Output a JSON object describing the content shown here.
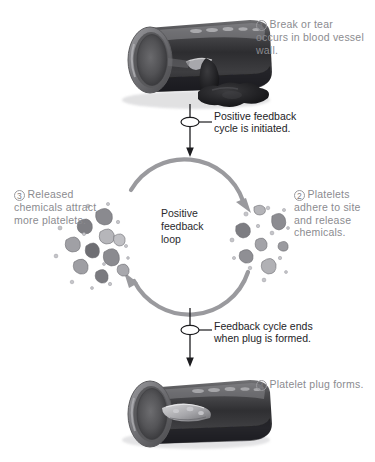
{
  "diagram": {
    "center_label": {
      "line1": "Positive",
      "line2": "feedback",
      "line3": "loop"
    },
    "steps": [
      {
        "number": "1",
        "text": "Break or tear occurs in blood vessel wall.",
        "icon": "blood-vessel-torn"
      },
      {
        "number": "2",
        "text": "Platelets adhere to site and release chemicals.",
        "icon": "platelet-cluster"
      },
      {
        "number": "3",
        "text": "Released chemicals attract more platelets.",
        "icon": "platelet-cluster"
      },
      {
        "number": "4",
        "text": "Platelet plug forms.",
        "icon": "blood-vessel-plugged"
      }
    ],
    "callouts": [
      {
        "id": "cycle-start",
        "line1": "Positive feedback",
        "line2": "cycle is initiated."
      },
      {
        "id": "cycle-end",
        "line1": "Feedback cycle ends",
        "line2": "when plug is formed."
      }
    ],
    "colors": {
      "label_text": "#8b8b8f",
      "callout_text": "#232326",
      "loop_arrow": "#9a9a9e",
      "flow_arrow": "#1c1c1f",
      "vessel_dark": "#3a3a3c",
      "platelet_gray": "#8e8e92",
      "background": "#ffffff"
    }
  }
}
